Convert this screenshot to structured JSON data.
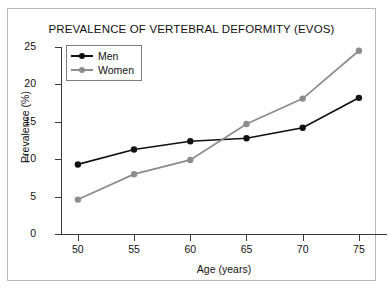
{
  "chart_data": {
    "type": "line",
    "title": "PREVALENCE OF VERTEBRAL DEFORMITY (EVOS)",
    "xlabel": "Age (years)",
    "ylabel": "Prevalence (%)",
    "x": [
      50,
      55,
      60,
      65,
      70,
      75
    ],
    "xticklabels": [
      "50",
      "55",
      "60",
      "65",
      "70",
      "75"
    ],
    "yticklabels": [
      "0",
      "5",
      "10",
      "15",
      "20",
      "25"
    ],
    "yticks": [
      0,
      5,
      10,
      15,
      20,
      25
    ],
    "xlim": [
      48.5,
      77.5
    ],
    "ylim": [
      0,
      25
    ],
    "grid": false,
    "legend_position": "upper left",
    "series": [
      {
        "name": "Men",
        "color": "#111111",
        "marker": "circle",
        "x": [
          50,
          55,
          60,
          65,
          70,
          75
        ],
        "values": [
          9.3,
          11.3,
          12.4,
          12.8,
          14.2,
          18.2
        ]
      },
      {
        "name": "Women",
        "color": "#8c8c8c",
        "marker": "circle",
        "x": [
          50,
          55,
          60,
          65,
          70,
          75
        ],
        "values": [
          4.6,
          8.0,
          9.9,
          14.7,
          18.1,
          24.5
        ]
      }
    ]
  }
}
